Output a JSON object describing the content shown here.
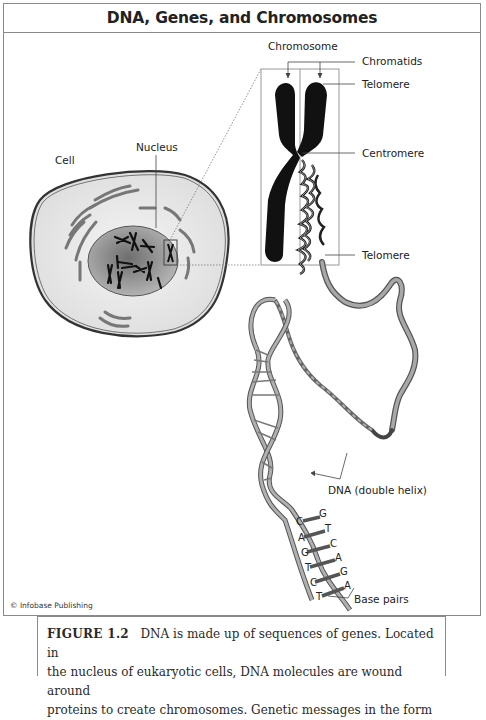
{
  "figure": {
    "title": "DNA, Genes, and Chromosomes",
    "labels": {
      "chromosome": "Chromosome",
      "chromatids": "Chromatids",
      "telomere_top": "Telomere",
      "centromere": "Centromere",
      "telomere_bottom": "Telomere",
      "nucleus": "Nucleus",
      "cell": "Cell",
      "dna": "DNA (double helix)",
      "base_pairs": "Base pairs"
    },
    "base_letters_left": [
      "C",
      "A",
      "G",
      "T",
      "C",
      "T"
    ],
    "base_letters_right": [
      "G",
      "T",
      "C",
      "A",
      "G",
      "A"
    ],
    "credit": "© Infobase Publishing"
  },
  "caption": {
    "label": "FIGURE 1.2",
    "line1": "DNA is made up of sequences of genes. Located in",
    "line2": "the nucleus of eukaryotic cells, DNA molecules are wound around",
    "line3": "proteins to create chromosomes. Genetic messages in the form"
  },
  "colors": {
    "frame": "#8a8a8a",
    "chromosome": "#111111",
    "cell_fill": "#e8e8e8",
    "nucleus_fill": "#9a9a9a",
    "dna_strand": "#8c8c8c"
  }
}
